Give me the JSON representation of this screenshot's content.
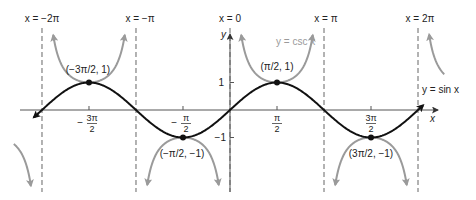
{
  "chart_data": {
    "type": "line",
    "title": "",
    "xlabel": "x",
    "ylabel": "y",
    "series": [
      {
        "name": "y = sin x",
        "color": "#111111",
        "function": "sin",
        "x_range": [
          -6.6,
          6.5
        ]
      },
      {
        "name": "y = csc x",
        "color": "#9a9a9a",
        "function": "csc",
        "x_range": [
          -6.6,
          6.5
        ]
      }
    ],
    "asymptotes": [
      {
        "label": "x = −2π",
        "x": -6.2832
      },
      {
        "label": "x = −π",
        "x": -3.1416
      },
      {
        "label": "x = 0",
        "x": 0
      },
      {
        "label": "x = π",
        "x": 3.1416
      },
      {
        "label": "x = 2π",
        "x": 6.2832
      }
    ],
    "points": [
      {
        "label": "(−3π/2, 1)",
        "x": -4.7124,
        "y": 1
      },
      {
        "label": "(−π/2, −1)",
        "x": -1.5708,
        "y": -1
      },
      {
        "label": "(π/2, 1)",
        "x": 1.5708,
        "y": 1
      },
      {
        "label": "(3π/2, −1)",
        "x": 4.7124,
        "y": -1
      }
    ],
    "x_ticks": [
      {
        "value": -4.7124,
        "num": "3π",
        "den": "2",
        "neg": true
      },
      {
        "value": -1.5708,
        "num": "π",
        "den": "2",
        "neg": true
      },
      {
        "value": 1.5708,
        "num": "π",
        "den": "2",
        "neg": false
      },
      {
        "value": 4.7124,
        "num": "3π",
        "den": "2",
        "neg": false
      }
    ],
    "y_ticks": [
      {
        "value": 1,
        "label": "1"
      },
      {
        "value": -1,
        "label": "−1"
      }
    ],
    "grid": false,
    "legend_position": "inline"
  },
  "labels": {
    "asym_neg2pi": "x = −2π",
    "asym_negpi": "x = −π",
    "asym_zero": "x = 0",
    "asym_pi": "x = π",
    "asym_2pi": "x = 2π",
    "sin_label": "y = sin x",
    "csc_label": "y = csc x",
    "x_axis": "x",
    "y_axis": "y",
    "ytick_pos": "1",
    "ytick_neg": "−1",
    "pt1": "(−3π/2, 1)",
    "pt2": "(−π/2, −1)",
    "pt3": "(π/2, 1)",
    "pt4": "(3π/2, −1)"
  }
}
